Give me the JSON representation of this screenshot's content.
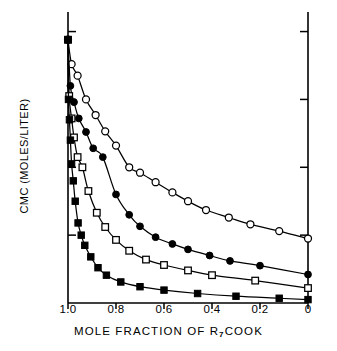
{
  "chart_data": {
    "type": "line",
    "title": "",
    "xlabel": "MOLE FRACTION OF R7COOK",
    "xlabel_parts": {
      "pre": "MOLE FRACTION OF  R",
      "sub": "7",
      "post": "COOK"
    },
    "ylabel": "CMC (MOLES/LITER)",
    "xlim": [
      1.0,
      0.0
    ],
    "ylim": [
      0.0,
      0.42
    ],
    "x_reversed": true,
    "grid": false,
    "legend": "none",
    "xticks": [
      "1.0",
      "0.8",
      "0.6",
      "0.4",
      "0.2",
      "0"
    ],
    "xtick_values": [
      1.0,
      0.8,
      0.6,
      0.4,
      0.2,
      0.0
    ],
    "yticks": [
      "0.40",
      "0.30",
      "0.20",
      "0.10",
      "0"
    ],
    "ytick_values": [
      0.4,
      0.3,
      0.2,
      0.1,
      0.0
    ],
    "series": [
      {
        "name": "open-circle",
        "marker": "open-circle",
        "x": [
          1.0,
          0.985,
          0.96,
          0.925,
          0.885,
          0.845,
          0.8,
          0.745,
          0.7,
          0.635,
          0.565,
          0.5,
          0.425,
          0.33,
          0.24,
          0.12,
          0.0
        ],
        "y": [
          0.388,
          0.352,
          0.335,
          0.3,
          0.277,
          0.253,
          0.232,
          0.2,
          0.192,
          0.178,
          0.163,
          0.15,
          0.137,
          0.126,
          0.116,
          0.106,
          0.095
        ]
      },
      {
        "name": "filled-circle",
        "marker": "filled-circle",
        "x": [
          1.0,
          0.99,
          0.975,
          0.955,
          0.925,
          0.895,
          0.855,
          0.8,
          0.745,
          0.7,
          0.635,
          0.565,
          0.5,
          0.41,
          0.325,
          0.2,
          0.0
        ],
        "y": [
          0.388,
          0.32,
          0.296,
          0.272,
          0.252,
          0.228,
          0.215,
          0.16,
          0.13,
          0.113,
          0.097,
          0.087,
          0.079,
          0.07,
          0.062,
          0.055,
          0.042
        ]
      },
      {
        "name": "open-square",
        "marker": "open-square",
        "x": [
          1.0,
          0.995,
          0.985,
          0.975,
          0.96,
          0.94,
          0.915,
          0.88,
          0.845,
          0.8,
          0.745,
          0.675,
          0.6,
          0.5,
          0.4,
          0.22,
          0.0
        ],
        "y": [
          0.388,
          0.305,
          0.272,
          0.244,
          0.215,
          0.2,
          0.165,
          0.133,
          0.112,
          0.093,
          0.077,
          0.064,
          0.056,
          0.048,
          0.041,
          0.033,
          0.022
        ]
      },
      {
        "name": "filled-square",
        "marker": "filled-square",
        "x": [
          1.0,
          0.998,
          0.994,
          0.99,
          0.985,
          0.978,
          0.97,
          0.958,
          0.945,
          0.93,
          0.905,
          0.875,
          0.84,
          0.78,
          0.7,
          0.6,
          0.46,
          0.3,
          0.12,
          0.0
        ],
        "y": [
          0.388,
          0.3,
          0.27,
          0.24,
          0.205,
          0.18,
          0.15,
          0.118,
          0.1,
          0.085,
          0.068,
          0.052,
          0.041,
          0.031,
          0.024,
          0.019,
          0.014,
          0.01,
          0.007,
          0.005
        ]
      }
    ]
  },
  "axes": {
    "stroke_color": "#000000",
    "marker_fill_open": "#ffffff",
    "marker_fill_solid": "#000000"
  }
}
